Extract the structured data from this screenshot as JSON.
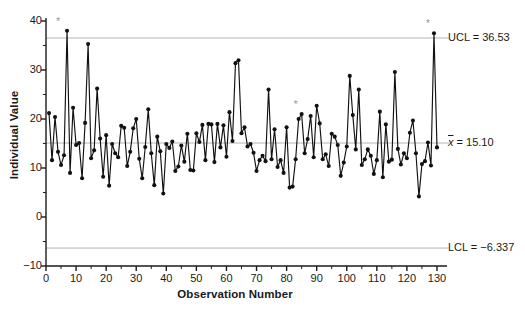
{
  "chart_data": {
    "type": "line",
    "title": "",
    "xlabel": "Observation Number",
    "ylabel": "Individual Value",
    "xlim": [
      0,
      132
    ],
    "ylim": [
      -10,
      40
    ],
    "grid": false,
    "legend": "none",
    "x_ticks_major": [
      0,
      10,
      20,
      30,
      40,
      50,
      60,
      70,
      80,
      90,
      100,
      110,
      120,
      130
    ],
    "x_ticks_minor_step": 5,
    "y_ticks_major": [
      -10,
      0,
      10,
      20,
      30,
      40
    ],
    "y_ticks_minor_step": 5,
    "control_lines": [
      {
        "name": "UCL",
        "label": "UCL = 36.53",
        "value": 36.53,
        "color": "#b4b4b4"
      },
      {
        "name": "center",
        "label": "x̄ = 15.10",
        "value": 15.1,
        "color": "#b4b4b4"
      },
      {
        "name": "LCL",
        "label": "LCL = −6.337",
        "value": -6.337,
        "color": "#b4b4b4"
      }
    ],
    "series_name": "Individual Value",
    "series_color": "#111111",
    "marker": "circle",
    "out_of_control_marker": "*",
    "out_of_control_points": [
      {
        "x": 6,
        "y": 38.0
      },
      {
        "x": 85,
        "y": 21.0
      },
      {
        "x": 129,
        "y": 37.5
      }
    ],
    "x": [
      1,
      2,
      3,
      4,
      5,
      6,
      7,
      8,
      9,
      10,
      11,
      12,
      13,
      14,
      15,
      16,
      17,
      18,
      19,
      20,
      21,
      22,
      23,
      24,
      25,
      26,
      27,
      28,
      29,
      30,
      31,
      32,
      33,
      34,
      35,
      36,
      37,
      38,
      39,
      40,
      41,
      42,
      43,
      44,
      45,
      46,
      47,
      48,
      49,
      50,
      51,
      52,
      53,
      54,
      55,
      56,
      57,
      58,
      59,
      60,
      61,
      62,
      63,
      64,
      65,
      66,
      67,
      68,
      69,
      70,
      71,
      72,
      73,
      74,
      75,
      76,
      77,
      78,
      79,
      80,
      81,
      82,
      83,
      84,
      85,
      86,
      87,
      88,
      89,
      90,
      91,
      92,
      93,
      94,
      95,
      96,
      97,
      98,
      99,
      100,
      101,
      102,
      103,
      104,
      105,
      106,
      107,
      108,
      109,
      110,
      111,
      112,
      113,
      114,
      115,
      116,
      117,
      118,
      119,
      120,
      121,
      122,
      123,
      124,
      125,
      126,
      127,
      128,
      129,
      130
    ],
    "values": [
      21.2,
      11.6,
      20.4,
      13.3,
      10.6,
      12.6,
      38.0,
      9.0,
      22.3,
      14.7,
      15.1,
      7.9,
      19.2,
      35.3,
      12.0,
      13.6,
      26.2,
      16.0,
      8.2,
      16.7,
      6.4,
      14.9,
      13.0,
      12.2,
      18.6,
      18.2,
      10.4,
      13.3,
      18.1,
      20.0,
      11.9,
      7.9,
      14.3,
      22.0,
      13.0,
      6.5,
      16.4,
      13.4,
      4.8,
      14.9,
      14.1,
      15.4,
      9.4,
      10.3,
      14.6,
      11.3,
      17.0,
      9.6,
      9.5,
      17.1,
      15.3,
      18.8,
      11.6,
      19.0,
      18.9,
      11.2,
      19.0,
      14.2,
      18.7,
      12.3,
      21.4,
      15.5,
      31.4,
      32.0,
      17.1,
      18.3,
      14.4,
      14.9,
      13.1,
      9.4,
      11.6,
      12.5,
      11.4,
      26.0,
      11.8,
      17.9,
      10.2,
      11.6,
      9.0,
      18.3,
      6.0,
      6.2,
      11.8,
      20.0,
      21.0,
      13.0,
      15.9,
      20.6,
      12.2,
      22.7,
      19.1,
      11.8,
      12.8,
      10.4,
      17.0,
      16.4,
      14.7,
      8.4,
      11.1,
      14.4,
      28.8,
      20.8,
      13.8,
      26.0,
      10.6,
      11.8,
      13.8,
      12.5,
      8.8,
      11.6,
      21.5,
      8.1,
      18.9,
      11.3,
      11.7,
      29.6,
      13.9,
      10.7,
      13.0,
      12.0,
      17.2,
      19.7,
      13.0,
      4.2,
      10.8,
      11.4,
      15.2,
      10.5,
      37.5,
      14.2
    ]
  }
}
